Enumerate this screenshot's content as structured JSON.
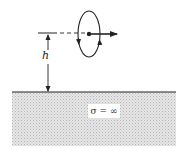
{
  "diagram": {
    "height_label": "h",
    "conductor_label": "σ = ∞",
    "colors": {
      "line": "#222222",
      "ground_fill": "#d9d9d9",
      "background": "#ffffff"
    }
  }
}
